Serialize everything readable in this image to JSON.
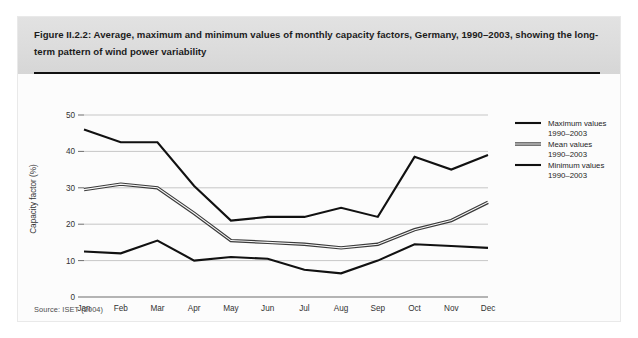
{
  "figure": {
    "caption": "Figure II.2.2: Average, maximum and minimum values of monthly capacity factors, Germany, 1990–2003, showing the long-term pattern of wind power variability",
    "source": "Source: ISET (2004)"
  },
  "chart_data": {
    "type": "line",
    "title": "",
    "xlabel": "",
    "ylabel": "Capacity factor (%)",
    "categories": [
      "Jan",
      "Feb",
      "Mar",
      "Apr",
      "May",
      "Jun",
      "Jul",
      "Aug",
      "Sep",
      "Oct",
      "Nov",
      "Dec"
    ],
    "ylim": [
      0,
      50
    ],
    "yticks": [
      0,
      10,
      20,
      30,
      40,
      50
    ],
    "grid": true,
    "legend_position": "right",
    "series": [
      {
        "name": "Maximum values 1990–2003",
        "style": "single-line",
        "values": [
          46.0,
          42.5,
          42.5,
          30.5,
          21.0,
          22.0,
          22.0,
          24.5,
          22.0,
          38.5,
          35.0,
          39.0
        ]
      },
      {
        "name": "Mean values 1990–2003",
        "style": "double-line",
        "values": [
          29.5,
          31.0,
          30.0,
          23.0,
          15.5,
          15.0,
          14.5,
          13.5,
          14.5,
          18.5,
          21.0,
          26.0
        ]
      },
      {
        "name": "Minimum values 1990–2003",
        "style": "single-line",
        "values": [
          12.5,
          12.0,
          15.5,
          10.0,
          11.0,
          10.5,
          7.5,
          6.5,
          10.0,
          14.5,
          14.0,
          13.5
        ]
      }
    ]
  },
  "legend": {
    "items": [
      {
        "line1": "Maximum values",
        "line2": "1990–2003",
        "style": "single"
      },
      {
        "line1": "Mean values",
        "line2": "1990–2003",
        "style": "double"
      },
      {
        "line1": "Minimum values",
        "line2": "1990–2003",
        "style": "single"
      }
    ]
  }
}
